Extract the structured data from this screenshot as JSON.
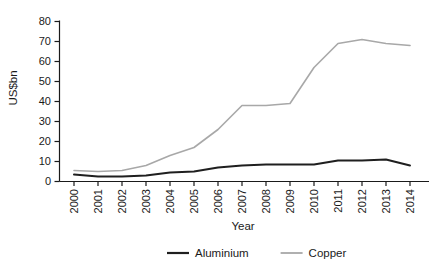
{
  "chart_data": {
    "type": "line",
    "title": "",
    "xlabel": "Year",
    "ylabel": "US$bn",
    "x": [
      2000,
      2001,
      2002,
      2003,
      2004,
      2005,
      2006,
      2007,
      2008,
      2009,
      2010,
      2011,
      2012,
      2013,
      2014
    ],
    "series": [
      {
        "name": "Aluminium",
        "color": "#1f1f1f",
        "stroke_width": 2,
        "values": [
          3.5,
          2.5,
          2.5,
          3,
          4.5,
          5,
          7,
          8,
          8.5,
          8.5,
          8.5,
          10.5,
          10.5,
          11,
          8
        ]
      },
      {
        "name": "Copper",
        "color": "#a8a8a8",
        "stroke_width": 1.6,
        "values": [
          5.5,
          5,
          5.5,
          8,
          13,
          17,
          26,
          38,
          38,
          39,
          57,
          69,
          71,
          69,
          68
        ]
      }
    ],
    "ylim": [
      0,
      80
    ],
    "ytick_step": 10,
    "yticks": [
      "0",
      "10",
      "20",
      "30",
      "40",
      "50",
      "60",
      "70",
      "80"
    ],
    "xticks": [
      "2000",
      "2001",
      "2002",
      "2003",
      "2004",
      "2005",
      "2006",
      "2007",
      "2008",
      "2009",
      "2010",
      "2011",
      "2012",
      "2013",
      "2014"
    ],
    "grid": false,
    "legend_position": "bottom",
    "background": "#ffffff",
    "axis_color": "#1a1a1a"
  }
}
